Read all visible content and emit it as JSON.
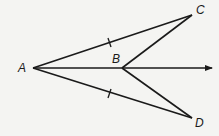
{
  "diagram": {
    "points": {
      "A": {
        "label": "A",
        "x": 33,
        "y": 68
      },
      "B": {
        "label": "B",
        "x": 122,
        "y": 68
      },
      "C": {
        "label": "C",
        "x": 192,
        "y": 15
      },
      "D": {
        "label": "D",
        "x": 192,
        "y": 118
      }
    },
    "segments": [
      "AC",
      "AD",
      "BC",
      "BD"
    ],
    "ray": {
      "from": "A",
      "through": "B"
    },
    "congruence_marks": [
      "AC",
      "AD"
    ],
    "line_color": "#1a1a1a"
  }
}
